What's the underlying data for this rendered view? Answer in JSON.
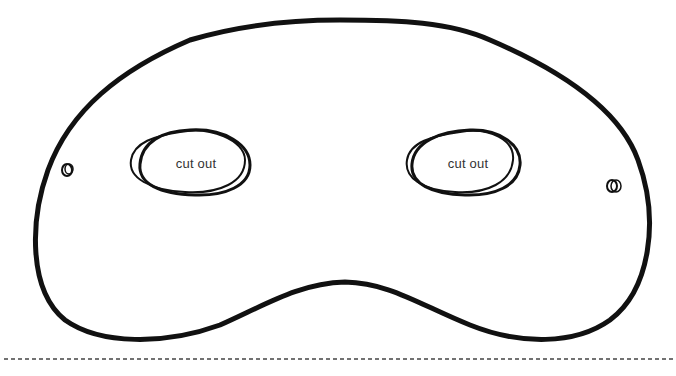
{
  "template": {
    "type": "printable eye mask cutout",
    "colors": {
      "outline": "#111111",
      "background": "#ffffff",
      "text": "#333333",
      "cut_line": "#444444"
    }
  },
  "eye_holes": [
    {
      "side": "left",
      "label": "cut out"
    },
    {
      "side": "right",
      "label": "cut out"
    }
  ],
  "string_holes": [
    {
      "side": "left"
    },
    {
      "side": "right"
    }
  ],
  "cut_line": {
    "style": "dashed"
  }
}
